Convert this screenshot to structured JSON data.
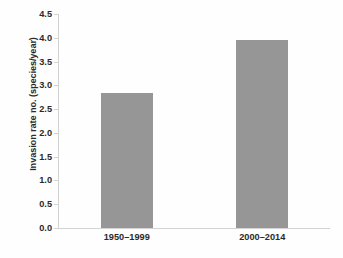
{
  "chart_data": {
    "type": "bar",
    "title": "",
    "subtitle": "",
    "xlabel": "",
    "ylabel": "Invasion rate no. (species/year)",
    "categories": [
      "1950–1999",
      "2000–2014"
    ],
    "values": [
      2.83,
      3.95
    ],
    "series": [
      {
        "name": "Invasion rate",
        "values": [
          2.83,
          3.95
        ]
      }
    ],
    "ylim": [
      0.0,
      4.5
    ],
    "y_ticks": [
      0.0,
      0.5,
      1.0,
      1.5,
      2.0,
      2.5,
      3.0,
      3.5,
      4.0,
      4.5
    ],
    "y_tick_labels": [
      "0.0",
      "0.5",
      "1.0",
      "1.5",
      "2.0",
      "2.5",
      "3.0",
      "3.5",
      "4.0",
      "4.5"
    ],
    "grid": false,
    "legend": false,
    "legend_position": "none",
    "bar_color": "#969696",
    "axis_color": "#d2d2d2",
    "text_color": "#2a2a2a",
    "background_color": "#ffffff",
    "annotations": []
  }
}
